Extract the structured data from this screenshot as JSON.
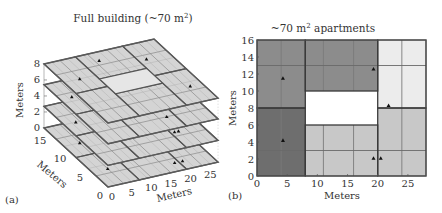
{
  "chart_data": [
    {
      "panel": "(a)",
      "type": "3d-floor-plan",
      "title": "Full building (~70 m²)",
      "title_text": "Full building (~70 m",
      "title_sup": "2",
      "title_tail": ")",
      "xlabel": "Meters",
      "ylabel": "Meters",
      "zlabel": "Meters",
      "x_ticks": [
        0,
        5,
        10,
        15,
        20,
        25
      ],
      "y_ticks": [
        0,
        5,
        10,
        15
      ],
      "z_ticks": [
        0,
        2,
        4,
        6,
        8
      ],
      "xlim": [
        0,
        28
      ],
      "ylim": [
        0,
        16
      ],
      "zlim": [
        0,
        8
      ],
      "floors_z": [
        0,
        2.7,
        5.4,
        8
      ],
      "floor_count": 4,
      "grid_on": false,
      "floor_color": "#d4d4d4",
      "wall_color": "#555555",
      "grid_line_color": "#8a8a8a",
      "sensors": [
        {
          "floor": 3,
          "x": 4,
          "y": 11
        },
        {
          "floor": 3,
          "x": 12,
          "y": 14
        },
        {
          "floor": 3,
          "x": 22,
          "y": 12
        },
        {
          "floor": 3,
          "x": 25,
          "y": 4
        },
        {
          "floor": 2,
          "x": 3,
          "y": 12
        },
        {
          "floor": 2,
          "x": 9,
          "y": 8
        },
        {
          "floor": 2,
          "x": 20,
          "y": 8
        },
        {
          "floor": 2,
          "x": 18,
          "y": 3
        },
        {
          "floor": 1,
          "x": 3,
          "y": 11
        },
        {
          "floor": 1,
          "x": 8,
          "y": 9
        },
        {
          "floor": 1,
          "x": 17,
          "y": 14
        },
        {
          "floor": 1,
          "x": 21,
          "y": 4
        },
        {
          "floor": 1,
          "x": 22,
          "y": 4
        },
        {
          "floor": 0,
          "x": 4,
          "y": 11
        },
        {
          "floor": 0,
          "x": 9,
          "y": 9
        },
        {
          "floor": 0,
          "x": 4,
          "y": 4
        },
        {
          "floor": 0,
          "x": 19,
          "y": 2
        },
        {
          "floor": 0,
          "x": 21,
          "y": 2
        }
      ]
    },
    {
      "panel": "(b)",
      "type": "floor-plan",
      "title": "~70 m² apartments",
      "title_pre": "~70 m",
      "title_sup": "2",
      "title_tail": " apartments",
      "xlabel": "Meters",
      "ylabel": "Meters",
      "x_ticks": [
        0,
        5,
        10,
        15,
        20,
        25
      ],
      "y_ticks": [
        0,
        2,
        4,
        6,
        8,
        10,
        12,
        14,
        16
      ],
      "xlim": [
        0,
        28
      ],
      "ylim": [
        0,
        16
      ],
      "grid_on": false,
      "apartments": [
        {
          "name": "upper-left",
          "x0": 0,
          "x1": 8,
          "y0": 8,
          "y1": 16,
          "color": "#8c8c8c",
          "inner_lines": {
            "x": [
              4
            ],
            "y": [
              13
            ]
          }
        },
        {
          "name": "upper-middle",
          "x0": 8,
          "x1": 20,
          "y0": 10,
          "y1": 16,
          "color": "#8c8c8c",
          "inner_lines": {
            "x": [
              11,
              16
            ],
            "y": [
              13
            ]
          }
        },
        {
          "name": "upper-right",
          "x0": 20,
          "x1": 28,
          "y0": 8,
          "y1": 16,
          "color": "#ececec",
          "inner_lines": {
            "x": [
              24
            ],
            "y": [
              13
            ]
          }
        },
        {
          "name": "lower-left",
          "x0": 0,
          "x1": 8,
          "y0": 0,
          "y1": 8,
          "color": "#6e6e6e",
          "inner_lines": {
            "x": [
              4
            ],
            "y": [
              3
            ]
          }
        },
        {
          "name": "lower-middle",
          "x0": 8,
          "x1": 20,
          "y0": 0,
          "y1": 6,
          "color": "#c8c8c8",
          "inner_lines": {
            "x": [
              11,
              16
            ],
            "y": [
              3
            ]
          }
        },
        {
          "name": "lower-right",
          "x0": 20,
          "x1": 28,
          "y0": 0,
          "y1": 8,
          "color": "#c8c8c8",
          "inner_lines": {
            "x": [
              24
            ],
            "y": [
              3
            ]
          }
        }
      ],
      "void": {
        "x0": 8,
        "x1": 20,
        "y0": 6,
        "y1": 10,
        "color": "#ffffff"
      },
      "sensors": [
        {
          "x": 4.3,
          "y": 11.5
        },
        {
          "x": 19.3,
          "y": 12.6
        },
        {
          "x": 21.8,
          "y": 8.3
        },
        {
          "x": 4.3,
          "y": 4.2
        },
        {
          "x": 19.3,
          "y": 2.1
        },
        {
          "x": 20.5,
          "y": 2.1
        }
      ]
    }
  ],
  "labels": {
    "panel_a": "(a)",
    "panel_b": "(b)"
  }
}
